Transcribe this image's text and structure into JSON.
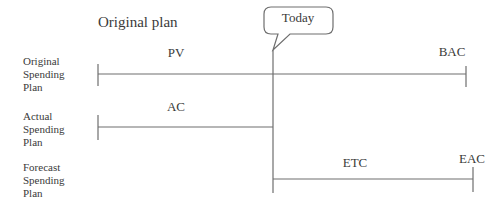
{
  "title": "Original plan",
  "today_callout": "Today",
  "rows": [
    {
      "label_lines": [
        "Original",
        "Spending",
        "Plan"
      ],
      "segment_label": "PV",
      "end_label": "BAC"
    },
    {
      "label_lines": [
        "Actual",
        "Spending",
        "Plan"
      ],
      "segment_label": "AC"
    },
    {
      "label_lines": [
        "Forecast",
        "Spending",
        "Plan"
      ],
      "segment_label": "ETC",
      "end_label": "EAC"
    }
  ],
  "colors": {
    "line": "#6e6e6e",
    "text": "#3a3a3a",
    "background": "#ffffff"
  }
}
